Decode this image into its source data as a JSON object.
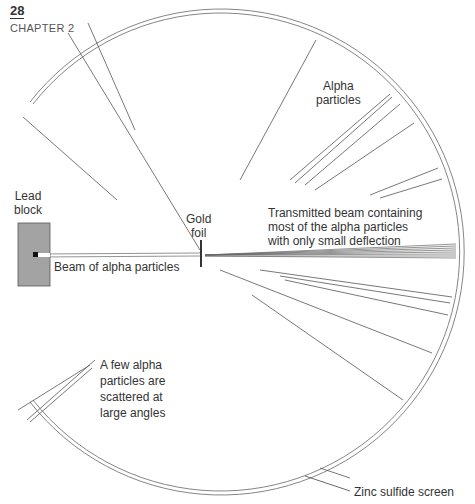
{
  "header": {
    "page_number": "28",
    "chapter": "CHAPTER 2"
  },
  "labels": {
    "lead_block": [
      "Lead",
      "block"
    ],
    "gold_foil": [
      "Gold",
      "foil"
    ],
    "beam": "Beam of alpha particles",
    "alpha_particles": [
      "Alpha",
      "particles"
    ],
    "transmitted": [
      "Transmitted beam containing",
      "most of the alpha particles",
      "with only small deflection"
    ],
    "few_alpha": [
      "A few alpha",
      "particles are",
      "scattered at",
      "large angles"
    ],
    "screen": "Zinc sulfide screen"
  },
  "colors": {
    "line": "#444444",
    "lead": "#a3a3a3",
    "screen": "#777777"
  }
}
